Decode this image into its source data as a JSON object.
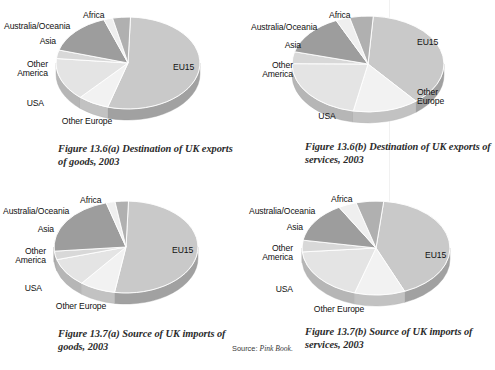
{
  "page": {
    "cut_off_header": "",
    "source_note_prefix": "Source:",
    "source_note_italic": "Pink Book."
  },
  "palette": {
    "eu15": "#c9c9c9",
    "other_europe": "#f2f2f2",
    "usa": "#e4e4e4",
    "other_america": "#d8d8d8",
    "asia": "#9d9d9d",
    "australia_oceania": "#efefef",
    "africa": "#b0b0b0",
    "pie_side": "#aeaeae",
    "edge": "#ffffff",
    "caption_color": "#2b2b2b",
    "label_color": "#111111"
  },
  "labels": {
    "eu15": "EU15",
    "other_europe": "Other Europe",
    "usa": "USA",
    "other_america_line1": "Other",
    "other_america_line2": "America",
    "asia": "Asia",
    "australia_oceania": "Australia/Oceania",
    "africa": "Africa"
  },
  "charts": [
    {
      "id": "fig-13-6-a",
      "caption": "Figure 13.6(a)  Destination of UK exports of goods, 2003",
      "caption_label": "Figure 13.6(a)",
      "caption_text": "Destination of UK exports of goods, 2003"
    },
    {
      "id": "fig-13-6-b",
      "caption": "Figure 13.6(b)  Destination of UK exports of services, 2003",
      "caption_label": "Figure 13.6(b)",
      "caption_text": "Destination of UK exports of services, 2003"
    },
    {
      "id": "fig-13-7-a",
      "caption": "Figure 13.7(a)  Source of UK imports of goods, 2003",
      "caption_label": "Figure 13.7(a)",
      "caption_text": "Source of UK imports of goods, 2003"
    },
    {
      "id": "fig-13-7-b",
      "caption": "Figure 13.7(b)  Source of UK imports of services, 2003",
      "caption_label": "Figure 13.7(b)",
      "caption_text": "Source of UK imports of services, 2003"
    }
  ],
  "chart_data": [
    {
      "type": "pie",
      "title": "Figure 13.6(a)  Destination of UK exports of goods, 2003",
      "categories": [
        "EU15",
        "Other Europe",
        "USA",
        "Other America",
        "Asia",
        "Australia/Oceania",
        "Africa"
      ],
      "values": [
        54,
        7,
        15,
        3,
        15,
        2,
        4
      ],
      "unit": "% of total",
      "colors": [
        "#c9c9c9",
        "#f2f2f2",
        "#e4e4e4",
        "#d8d8d8",
        "#9d9d9d",
        "#efefef",
        "#b0b0b0"
      ],
      "legend": "labels placed around pie",
      "three_d": true,
      "start_angle_deg": -90
    },
    {
      "type": "pie",
      "title": "Figure 13.6(b)  Destination of UK exports of services, 2003",
      "categories": [
        "EU15",
        "Other Europe",
        "USA",
        "Other America",
        "Asia",
        "Australia/Oceania",
        "Africa"
      ],
      "values": [
        38,
        14,
        22,
        4,
        14,
        3,
        5
      ],
      "unit": "% of total",
      "colors": [
        "#c9c9c9",
        "#f2f2f2",
        "#e4e4e4",
        "#d8d8d8",
        "#9d9d9d",
        "#efefef",
        "#b0b0b0"
      ],
      "legend": "labels placed around pie",
      "three_d": true,
      "start_angle_deg": -90
    },
    {
      "type": "pie",
      "title": "Figure 13.7(a)  Source of UK imports of goods, 2003",
      "categories": [
        "EU15",
        "Other Europe",
        "USA",
        "Other America",
        "Asia",
        "Australia/Oceania",
        "Africa"
      ],
      "values": [
        52,
        8,
        10,
        3,
        22,
        2,
        3
      ],
      "unit": "% of total",
      "colors": [
        "#c9c9c9",
        "#f2f2f2",
        "#e4e4e4",
        "#d8d8d8",
        "#9d9d9d",
        "#efefef",
        "#b0b0b0"
      ],
      "legend": "labels placed around pie",
      "three_d": true,
      "start_angle_deg": -90
    },
    {
      "type": "pie",
      "title": "Figure 13.7(b)  Source of UK imports of services, 2003",
      "categories": [
        "EU15",
        "Other Europe",
        "USA",
        "Other America",
        "Asia",
        "Australia/Oceania",
        "Africa"
      ],
      "values": [
        42,
        11,
        19,
        4,
        14,
        4,
        6
      ],
      "unit": "% of total",
      "colors": [
        "#c9c9c9",
        "#f2f2f2",
        "#e4e4e4",
        "#d8d8d8",
        "#9d9d9d",
        "#efefef",
        "#b0b0b0"
      ],
      "legend": "labels placed around pie",
      "three_d": true,
      "start_angle_deg": -90
    }
  ]
}
